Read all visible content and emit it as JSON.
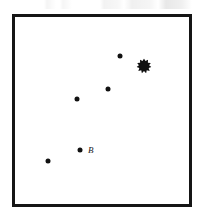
{
  "figure": {
    "caption": "",
    "frame": {
      "x": 12,
      "y": 14,
      "width": 180,
      "height": 193,
      "border_color": "#151515",
      "border_width": 3,
      "background": "#ffffff"
    }
  },
  "chart_data": {
    "type": "scatter",
    "title": "",
    "xlabel": "",
    "ylabel": "",
    "grid": false,
    "legend": null,
    "xlim": [
      0,
      180
    ],
    "ylim": [
      0,
      193
    ],
    "marker_color": "#111111",
    "series": [
      {
        "name": "stars",
        "marker": "filled-circle",
        "points": [
          {
            "x": 105,
            "y": 39,
            "size": 5,
            "label": ""
          },
          {
            "x": 93,
            "y": 72,
            "size": 5,
            "label": ""
          },
          {
            "x": 62,
            "y": 82,
            "size": 5,
            "label": ""
          },
          {
            "x": 65,
            "y": 133,
            "size": 5,
            "label": "B"
          },
          {
            "x": 33,
            "y": 144,
            "size": 5,
            "label": ""
          }
        ]
      },
      {
        "name": "cluster",
        "marker": "starburst",
        "points": [
          {
            "x": 129,
            "y": 49,
            "size": 15,
            "label": ""
          }
        ]
      }
    ],
    "annotations": [
      {
        "text": "B",
        "x": 73,
        "y": 133,
        "style": "italic"
      }
    ]
  }
}
